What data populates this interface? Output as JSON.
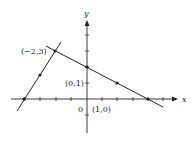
{
  "axes": {
    "x_label": "x",
    "y_label": "y",
    "origin_label": "0"
  },
  "labels": {
    "p1": "(−2,3)",
    "p2": "(0,1)",
    "p3": "(1,0)"
  },
  "lines": [
    {
      "name": "line-1",
      "points": [
        [
          -4,
          0
        ],
        [
          -3,
          1.5
        ],
        [
          -2,
          3
        ]
      ]
    },
    {
      "name": "line-2",
      "points": [
        [
          -2,
          3
        ],
        [
          0,
          2
        ],
        [
          2,
          1
        ],
        [
          4,
          0
        ]
      ]
    }
  ],
  "colors": {
    "ink": "#222222",
    "background": "#ffffff"
  }
}
